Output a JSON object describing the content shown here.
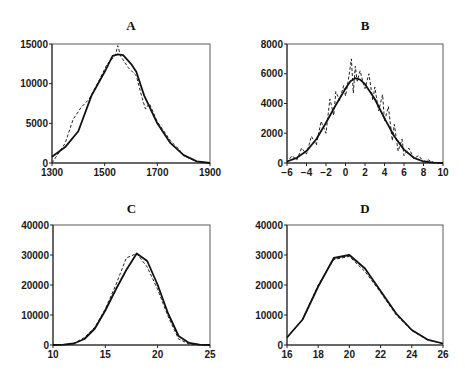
{
  "chart_data": [
    {
      "type": "line",
      "title": "A",
      "xlabel": "",
      "ylabel": "",
      "xlim": [
        1300,
        1900
      ],
      "ylim": [
        0,
        15000
      ],
      "xticks": [
        1300,
        1500,
        1700,
        1900
      ],
      "yticks": [
        0,
        5000,
        10000,
        15000
      ],
      "grid": false,
      "series": [
        {
          "name": "solid",
          "style": "solid",
          "x": [
            1300,
            1350,
            1400,
            1450,
            1500,
            1530,
            1550,
            1570,
            1600,
            1620,
            1650,
            1700,
            1750,
            1800,
            1850,
            1900
          ],
          "y": [
            800,
            2000,
            4000,
            8500,
            11500,
            13500,
            13700,
            13600,
            12500,
            11500,
            8500,
            5000,
            2500,
            1000,
            200,
            0
          ]
        },
        {
          "name": "dashed",
          "style": "dashed",
          "x": [
            1300,
            1350,
            1380,
            1410,
            1440,
            1480,
            1510,
            1540,
            1550,
            1560,
            1590,
            1620,
            1640,
            1655,
            1670,
            1700,
            1750,
            1780,
            1800,
            1850,
            1900
          ],
          "y": [
            0,
            2500,
            5500,
            7000,
            8000,
            10500,
            12500,
            13500,
            14800,
            13500,
            12000,
            11000,
            8500,
            6800,
            7500,
            5200,
            2800,
            1800,
            900,
            200,
            0
          ]
        }
      ]
    },
    {
      "type": "line",
      "title": "B",
      "xlabel": "",
      "ylabel": "",
      "xlim": [
        -6,
        10
      ],
      "ylim": [
        0,
        8000
      ],
      "xticks": [
        -6,
        -4,
        -2,
        0,
        2,
        4,
        6,
        8,
        10
      ],
      "yticks": [
        0,
        2000,
        4000,
        6000,
        8000
      ],
      "grid": false,
      "series": [
        {
          "name": "solid",
          "style": "solid",
          "x": [
            -6,
            -5,
            -4,
            -3,
            -2,
            -1,
            0,
            0.5,
            1,
            1.5,
            2,
            3,
            4,
            5,
            6,
            7,
            8,
            9,
            10
          ],
          "y": [
            100,
            350,
            800,
            1600,
            2700,
            3900,
            5000,
            5500,
            5700,
            5600,
            5300,
            4300,
            3000,
            1800,
            900,
            350,
            100,
            30,
            0
          ]
        },
        {
          "name": "dashed",
          "style": "dashed",
          "x": [
            -6,
            -5.5,
            -5,
            -4.5,
            -4,
            -3.5,
            -3,
            -2.5,
            -2,
            -1.6,
            -1.2,
            -1,
            -0.6,
            -0.2,
            0,
            0.3,
            0.6,
            0.8,
            1,
            1.2,
            1.5,
            1.8,
            2,
            2.4,
            2.8,
            3,
            3.4,
            3.8,
            4,
            4.4,
            4.8,
            5,
            5.4,
            5.8,
            6,
            6.5,
            7,
            7.5,
            8,
            8.5,
            9,
            10
          ],
          "y": [
            0,
            500,
            200,
            1000,
            600,
            1800,
            1200,
            2800,
            2000,
            4300,
            3200,
            4800,
            4200,
            5200,
            4500,
            5600,
            7000,
            4700,
            6500,
            5500,
            6200,
            5400,
            5000,
            6000,
            4200,
            5100,
            3500,
            4600,
            2800,
            3800,
            1500,
            2600,
            800,
            1600,
            500,
            1000,
            300,
            500,
            100,
            200,
            50,
            0
          ]
        }
      ]
    },
    {
      "type": "line",
      "title": "C",
      "xlabel": "",
      "ylabel": "",
      "xlim": [
        10,
        25
      ],
      "ylim": [
        0,
        40000
      ],
      "xticks": [
        10,
        15,
        20,
        25
      ],
      "yticks": [
        0,
        10000,
        20000,
        30000,
        40000
      ],
      "grid": false,
      "series": [
        {
          "name": "solid",
          "style": "solid",
          "x": [
            10,
            11,
            12,
            13,
            14,
            15,
            16,
            17,
            18,
            19,
            20,
            21,
            22,
            23,
            24,
            25
          ],
          "y": [
            0,
            100,
            500,
            2000,
            5500,
            11500,
            18500,
            25000,
            30500,
            28000,
            20000,
            10500,
            3000,
            700,
            100,
            0
          ]
        },
        {
          "name": "dashed",
          "style": "dashed",
          "x": [
            10,
            11,
            12,
            13,
            14,
            15,
            16,
            17,
            18,
            19,
            20,
            21,
            22,
            23,
            24,
            25
          ],
          "y": [
            0,
            100,
            500,
            2500,
            6000,
            12000,
            20000,
            29000,
            30500,
            26000,
            18500,
            9500,
            2000,
            300,
            0,
            0
          ]
        }
      ]
    },
    {
      "type": "line",
      "title": "D",
      "xlabel": "",
      "ylabel": "",
      "xlim": [
        16,
        26
      ],
      "ylim": [
        0,
        40000
      ],
      "xticks": [
        16,
        18,
        20,
        22,
        24,
        26
      ],
      "yticks": [
        0,
        10000,
        20000,
        30000,
        40000
      ],
      "grid": false,
      "series": [
        {
          "name": "solid",
          "style": "solid",
          "x": [
            16,
            17,
            18,
            19,
            20,
            21,
            22,
            23,
            24,
            25,
            26
          ],
          "y": [
            2500,
            8500,
            19500,
            29000,
            30000,
            25500,
            18000,
            10500,
            5000,
            1800,
            500
          ]
        },
        {
          "name": "dashed",
          "style": "dashed",
          "x": [
            16,
            17,
            18,
            19,
            20,
            21,
            22,
            23,
            24,
            25,
            26
          ],
          "y": [
            2500,
            8500,
            20000,
            28500,
            29500,
            24500,
            17500,
            10000,
            4800,
            1700,
            500
          ]
        }
      ]
    }
  ]
}
